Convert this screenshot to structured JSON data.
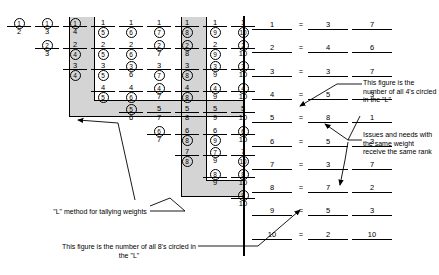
{
  "figure": {
    "title_hidden": "",
    "type": "paired-comparison-L-method-tally"
  },
  "grid": {
    "description": "Paired comparison matrix; each cell shows an upper item number over a rule with the lower item number beneath. The circled number in each pair is the winner.",
    "rows": [
      {
        "row": 1,
        "cells": [
          {
            "top": "1",
            "bot": "2",
            "circled": "top"
          },
          {
            "top": "1",
            "bot": "3",
            "circled": "top"
          },
          {
            "top": "1",
            "bot": "4",
            "circled": "top"
          },
          {
            "top": "1",
            "bot": "5",
            "circled": "bot"
          },
          {
            "top": "1",
            "bot": "6",
            "circled": "bot"
          },
          {
            "top": "1",
            "bot": "7",
            "circled": "bot"
          },
          {
            "top": "1",
            "bot": "8",
            "circled": "bot"
          },
          {
            "top": "1",
            "bot": "9",
            "circled": "bot"
          },
          {
            "top": "1",
            "bot": "10",
            "circled": "bot"
          }
        ]
      },
      {
        "row": 2,
        "cells": [
          {
            "top": "2",
            "bot": "3",
            "circled": "top"
          },
          {
            "top": "2",
            "bot": "4",
            "circled": "bot"
          },
          {
            "top": "2",
            "bot": "5",
            "circled": "bot"
          },
          {
            "top": "2",
            "bot": "6",
            "circled": "bot"
          },
          {
            "top": "2",
            "bot": "7",
            "circled": "top"
          },
          {
            "top": "2",
            "bot": "8",
            "circled": "top"
          },
          {
            "top": "2",
            "bot": "9",
            "circled": "bot"
          },
          {
            "top": "2",
            "bot": "10",
            "circled": "top"
          }
        ]
      },
      {
        "row": 3,
        "cells": [
          {
            "top": "3",
            "bot": "4",
            "circled": "bot"
          },
          {
            "top": "3",
            "bot": "5",
            "circled": "bot"
          },
          {
            "top": "3",
            "bot": "6",
            "circled": "top"
          },
          {
            "top": "3",
            "bot": "7",
            "circled": "bot"
          },
          {
            "top": "3",
            "bot": "8",
            "circled": "bot"
          },
          {
            "top": "3",
            "bot": "9",
            "circled": "top"
          },
          {
            "top": "3",
            "bot": "10",
            "circled": "top"
          }
        ]
      },
      {
        "row": 4,
        "cells": [
          {
            "top": "4",
            "bot": "5",
            "circled": "bot"
          },
          {
            "top": "4",
            "bot": "6",
            "circled": "bot"
          },
          {
            "top": "4",
            "bot": "7",
            "circled": "top"
          },
          {
            "top": "4",
            "bot": "8",
            "circled": "bot"
          },
          {
            "top": "4",
            "bot": "9",
            "circled": "top"
          },
          {
            "top": "4",
            "bot": "10",
            "circled": "top"
          }
        ]
      },
      {
        "row": 5,
        "cells": [
          {
            "top": "5",
            "bot": "6",
            "circled": "top"
          },
          {
            "top": "5",
            "bot": "7",
            "circled": "none"
          },
          {
            "top": "5",
            "bot": "8",
            "circled": "none"
          },
          {
            "top": "5",
            "bot": "9",
            "circled": "none"
          },
          {
            "top": "5",
            "bot": "10",
            "circled": "none"
          }
        ]
      },
      {
        "row": 6,
        "cells": [
          {
            "top": "6",
            "bot": "7",
            "circled": "top"
          },
          {
            "top": "6",
            "bot": "8",
            "circled": "bot"
          },
          {
            "top": "6",
            "bot": "9",
            "circled": "bot"
          },
          {
            "top": "6",
            "bot": "10",
            "circled": "top"
          }
        ]
      },
      {
        "row": 7,
        "cells": [
          {
            "top": "7",
            "bot": "8",
            "circled": "bot"
          },
          {
            "top": "7",
            "bot": "9",
            "circled": "top"
          },
          {
            "top": "7",
            "bot": "10",
            "circled": "bot"
          }
        ]
      },
      {
        "row": 8,
        "cells": [
          {
            "top": "8",
            "bot": "9",
            "circled": "top"
          },
          {
            "top": "8",
            "bot": "10",
            "circled": "top"
          }
        ]
      },
      {
        "row": 9,
        "cells": [
          {
            "top": "9",
            "bot": "10",
            "circled": "top"
          }
        ]
      }
    ]
  },
  "tally": {
    "eq": "=",
    "rows": [
      {
        "item": "1",
        "count": "3",
        "rank": "7"
      },
      {
        "item": "2",
        "count": "4",
        "rank": "6"
      },
      {
        "item": "3",
        "count": "3",
        "rank": "7"
      },
      {
        "item": "4",
        "count": "5",
        "rank": "3"
      },
      {
        "item": "5",
        "count": "8",
        "rank": "1"
      },
      {
        "item": "6",
        "count": "5",
        "rank": "3"
      },
      {
        "item": "7",
        "count": "3",
        "rank": "7"
      },
      {
        "item": "8",
        "count": "7",
        "rank": "2"
      },
      {
        "item": "9",
        "count": "5",
        "rank": "3"
      },
      {
        "item": "10",
        "count": "2",
        "rank": "10"
      }
    ]
  },
  "notes": {
    "four_callout": "This figure is the number of all 4's circled in the \"L\"",
    "same_rank_callout": "Issues and needs with the same weight receive the same rank",
    "l_method_label": "\"L\" method for tallying weights",
    "eight_callout": "This figure is the number of all 8's circled in the \"L\""
  },
  "colors": {
    "ink": "#000000",
    "highlight": "#d4d4d4",
    "page": "#ffffff"
  }
}
